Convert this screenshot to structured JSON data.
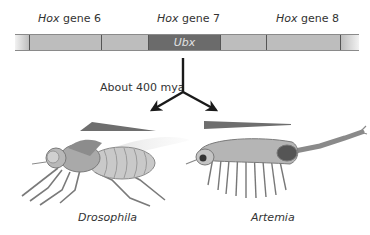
{
  "genes": [
    {
      "prefix": "Hox",
      "suffix": " gene 6"
    },
    {
      "prefix": "Hox",
      "suffix": " gene 7"
    },
    {
      "prefix": "Hox",
      "suffix": " gene 8"
    }
  ],
  "ubx_label": "Ubx",
  "divergence_label": "About 400 mya",
  "organisms": {
    "left": "Drosophila",
    "right": "Artemia"
  },
  "colors": {
    "segment": "#bdbdbd",
    "ubx_segment": "#6b6b6b",
    "wedge": "#6e6e6e"
  }
}
